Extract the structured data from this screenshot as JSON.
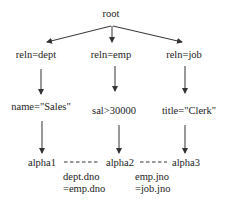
{
  "diagram": {
    "type": "query-tree",
    "colors": {
      "stroke": "#333333",
      "text": "#222222",
      "background": "#ffffff"
    },
    "root": {
      "label": "root"
    },
    "relations": [
      {
        "label": "reln=dept",
        "condition": "name=\"Sales\"",
        "alpha": "alpha1"
      },
      {
        "label": "reln=emp",
        "condition": "sal>30000",
        "alpha": "alpha2"
      },
      {
        "label": "reln=job",
        "condition": "title=\"Clerk\"",
        "alpha": "alpha3"
      }
    ],
    "joins": [
      {
        "from": "alpha1",
        "to": "alpha2",
        "line1": "dept.dno",
        "line2": "=emp.dno"
      },
      {
        "from": "alpha2",
        "to": "alpha3",
        "line1": "emp.jno",
        "line2": "=job.jno"
      }
    ]
  }
}
